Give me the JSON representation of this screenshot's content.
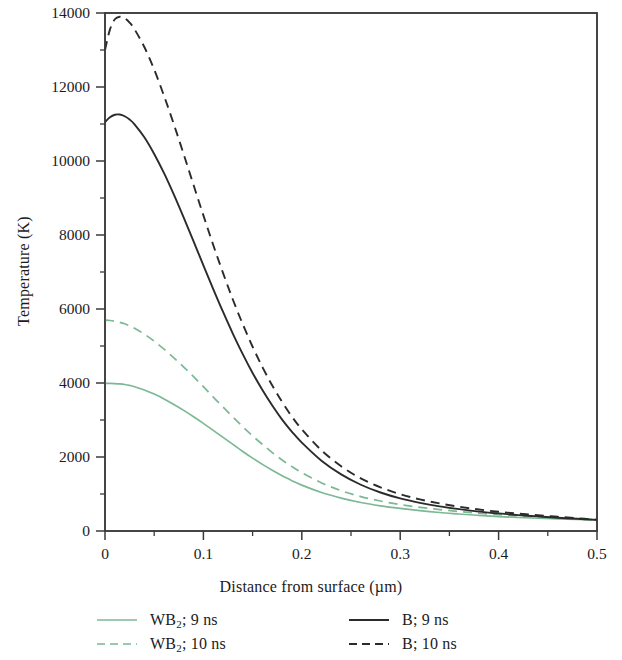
{
  "chart_data": {
    "type": "line",
    "title": "",
    "xlabel": "Distance from surface (µm)",
    "ylabel": "Temperature (K)",
    "xlim": [
      0,
      0.5
    ],
    "ylim": [
      0,
      14000
    ],
    "grid": false,
    "legend_position": "below-axes",
    "xticks": [
      0,
      0.1,
      0.2,
      0.3,
      0.4,
      0.5
    ],
    "xtick_labels": [
      "0",
      "0.1",
      "0.2",
      "0.3",
      "0.4",
      "0.5"
    ],
    "xminor_step": 0.05,
    "yticks": [
      0,
      2000,
      4000,
      6000,
      8000,
      10000,
      12000,
      14000
    ],
    "ytick_labels": [
      "0",
      "2000",
      "4000",
      "6000",
      "8000",
      "10000",
      "12000",
      "14000"
    ],
    "yminor_step": 1000,
    "series": [
      {
        "name": "WB2; 9 ns",
        "label_main": "WB",
        "label_sub": "2",
        "label_tail": "; 9 ns",
        "color": "#7cb894",
        "dash": "solid",
        "x": [
          0,
          0.005,
          0.01,
          0.015,
          0.02,
          0.025,
          0.03,
          0.04,
          0.05,
          0.06,
          0.07,
          0.08,
          0.09,
          0.1,
          0.11,
          0.12,
          0.13,
          0.14,
          0.15,
          0.16,
          0.17,
          0.18,
          0.19,
          0.2,
          0.22,
          0.24,
          0.26,
          0.28,
          0.3,
          0.32,
          0.34,
          0.36,
          0.38,
          0.4,
          0.42,
          0.44,
          0.46,
          0.48,
          0.5
        ],
        "y": [
          3990,
          3990,
          3985,
          3975,
          3960,
          3935,
          3900,
          3810,
          3700,
          3570,
          3420,
          3260,
          3090,
          2910,
          2720,
          2530,
          2340,
          2150,
          1970,
          1800,
          1640,
          1490,
          1360,
          1240,
          1040,
          890,
          770,
          680,
          610,
          550,
          500,
          460,
          420,
          390,
          365,
          345,
          330,
          315,
          300
        ]
      },
      {
        "name": "WB2; 10 ns",
        "label_main": "WB",
        "label_sub": "2",
        "label_tail": "; 10 ns",
        "color": "#7cb894",
        "dash": "dashed",
        "x": [
          0,
          0.005,
          0.01,
          0.015,
          0.02,
          0.025,
          0.03,
          0.04,
          0.05,
          0.06,
          0.07,
          0.08,
          0.09,
          0.1,
          0.11,
          0.12,
          0.13,
          0.14,
          0.15,
          0.16,
          0.17,
          0.18,
          0.19,
          0.2,
          0.22,
          0.24,
          0.26,
          0.28,
          0.3,
          0.32,
          0.34,
          0.36,
          0.38,
          0.4,
          0.42,
          0.44,
          0.46,
          0.48,
          0.5
        ],
        "y": [
          5700,
          5690,
          5670,
          5640,
          5600,
          5545,
          5480,
          5320,
          5130,
          4915,
          4680,
          4430,
          4170,
          3900,
          3620,
          3350,
          3080,
          2820,
          2570,
          2340,
          2120,
          1920,
          1740,
          1580,
          1300,
          1090,
          930,
          810,
          715,
          640,
          580,
          525,
          480,
          440,
          405,
          375,
          350,
          325,
          300
        ]
      },
      {
        "name": "B; 9 ns",
        "label_main": "B",
        "label_sub": "",
        "label_tail": "; 9 ns",
        "color": "#2b2b2b",
        "dash": "solid",
        "x": [
          0,
          0.005,
          0.01,
          0.015,
          0.02,
          0.025,
          0.03,
          0.04,
          0.05,
          0.06,
          0.07,
          0.08,
          0.09,
          0.1,
          0.11,
          0.12,
          0.13,
          0.14,
          0.15,
          0.16,
          0.17,
          0.18,
          0.19,
          0.2,
          0.22,
          0.24,
          0.26,
          0.28,
          0.3,
          0.32,
          0.34,
          0.36,
          0.38,
          0.4,
          0.42,
          0.44,
          0.46,
          0.48,
          0.5
        ],
        "y": [
          11050,
          11180,
          11250,
          11255,
          11210,
          11120,
          10990,
          10640,
          10190,
          9670,
          9090,
          8470,
          7830,
          7180,
          6540,
          5920,
          5330,
          4780,
          4270,
          3810,
          3390,
          3010,
          2680,
          2390,
          1900,
          1530,
          1250,
          1040,
          880,
          760,
          665,
          590,
          525,
          475,
          430,
          395,
          360,
          330,
          300
        ]
      },
      {
        "name": "B; 10 ns",
        "label_main": "B",
        "label_sub": "",
        "label_tail": "; 10 ns",
        "color": "#2b2b2b",
        "dash": "dashed",
        "x": [
          0,
          0.005,
          0.01,
          0.015,
          0.02,
          0.025,
          0.03,
          0.04,
          0.05,
          0.06,
          0.07,
          0.08,
          0.09,
          0.1,
          0.11,
          0.12,
          0.13,
          0.14,
          0.15,
          0.16,
          0.17,
          0.18,
          0.19,
          0.2,
          0.22,
          0.24,
          0.26,
          0.28,
          0.3,
          0.32,
          0.34,
          0.36,
          0.38,
          0.4,
          0.42,
          0.44,
          0.46,
          0.48,
          0.5
        ],
        "y": [
          13000,
          13550,
          13830,
          13900,
          13860,
          13740,
          13560,
          13080,
          12470,
          11760,
          10990,
          10180,
          9350,
          8530,
          7730,
          6970,
          6250,
          5590,
          4980,
          4430,
          3930,
          3490,
          3090,
          2750,
          2180,
          1750,
          1420,
          1180,
          995,
          855,
          745,
          655,
          580,
          520,
          470,
          425,
          385,
          345,
          305
        ]
      }
    ],
    "notes": {
      "peak_B_10ns": 13900,
      "peak_B_9ns": 11255,
      "surface_WB2_10ns": 5700,
      "surface_WB2_9ns": 3990,
      "tail_temperature": 300
    }
  },
  "axes": {
    "frame_color": "#3a3a3a"
  }
}
